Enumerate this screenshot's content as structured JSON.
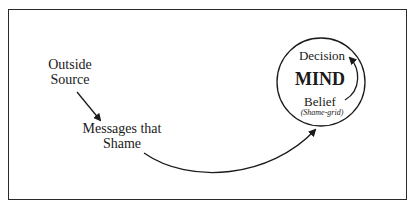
{
  "diagram": {
    "nodes": {
      "outside_source": {
        "line1": "Outside",
        "line2": "Source"
      },
      "messages": {
        "line1": "Messages that",
        "line2": "Shame"
      },
      "mind": {
        "title": "MIND",
        "decision": "Decision",
        "belief": "Belief",
        "belief_note": "(Shame-grid)"
      }
    },
    "edges": [
      {
        "from": "Outside Source",
        "to": "Messages that Shame"
      },
      {
        "from": "Messages that Shame",
        "to": "MIND"
      },
      {
        "from": "Belief",
        "to": "Decision"
      }
    ],
    "colors": {
      "line": "#1a1a1a",
      "background": "#ffffff"
    }
  }
}
